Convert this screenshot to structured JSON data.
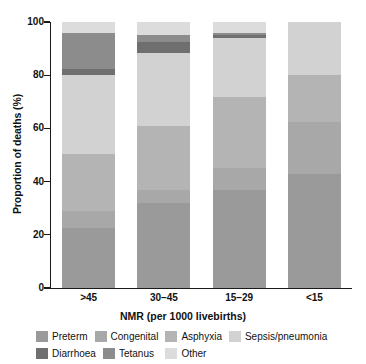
{
  "chart_data": {
    "type": "bar",
    "stacked": true,
    "title": "",
    "xlabel": "NMR (per 1000 livebirths)",
    "ylabel": "Proportion of deaths (%)",
    "categories": [
      ">45",
      "30–45",
      "15–29",
      "<15"
    ],
    "ylim": [
      0,
      100
    ],
    "yticks": [
      0,
      20,
      40,
      60,
      80,
      100
    ],
    "ytick_labels": [
      "0",
      "20",
      "40",
      "60",
      "80",
      "100"
    ],
    "grid": false,
    "legend_position": "bottom",
    "units": "percent",
    "series": [
      {
        "name": "Preterm",
        "color": "#9a9a9a",
        "values": [
          22.5,
          32.0,
          37.0,
          43.0
        ]
      },
      {
        "name": "Congenital",
        "color": "#a8a8a8",
        "values": [
          6.5,
          5.0,
          8.0,
          19.5
        ]
      },
      {
        "name": "Asphyxia",
        "color": "#b4b4b4",
        "values": [
          21.5,
          24.0,
          27.0,
          17.5
        ]
      },
      {
        "name": "Sepsis/pneumonia",
        "color": "#d2d2d2",
        "values": [
          29.5,
          27.5,
          22.0,
          20.0
        ]
      },
      {
        "name": "Diarrhoea",
        "color": "#6f6f6f",
        "values": [
          2.5,
          4.0,
          1.0,
          0.0
        ]
      },
      {
        "name": "Tetanus",
        "color": "#8c8c8c",
        "values": [
          13.5,
          2.5,
          1.0,
          0.0
        ]
      },
      {
        "name": "Other",
        "color": "#dcdcdc",
        "values": [
          4.0,
          5.0,
          4.0,
          0.0
        ]
      }
    ],
    "stack_order_bottom_to_top": [
      "Preterm",
      "Congenital",
      "Asphyxia",
      "Sepsis/pneumonia",
      "Diarrhoea",
      "Tetanus",
      "Other"
    ]
  },
  "legend": {
    "row1": [
      {
        "label": "Preterm",
        "color": "#9a9a9a"
      },
      {
        "label": "Congenital",
        "color": "#a8a8a8"
      },
      {
        "label": "Asphyxia",
        "color": "#b4b4b4"
      },
      {
        "label": "Sepsis/pneumonia",
        "color": "#d2d2d2"
      }
    ],
    "row2": [
      {
        "label": "Diarrhoea",
        "color": "#6f6f6f"
      },
      {
        "label": "Tetanus",
        "color": "#8c8c8c"
      },
      {
        "label": "Other",
        "color": "#dcdcdc"
      }
    ]
  }
}
